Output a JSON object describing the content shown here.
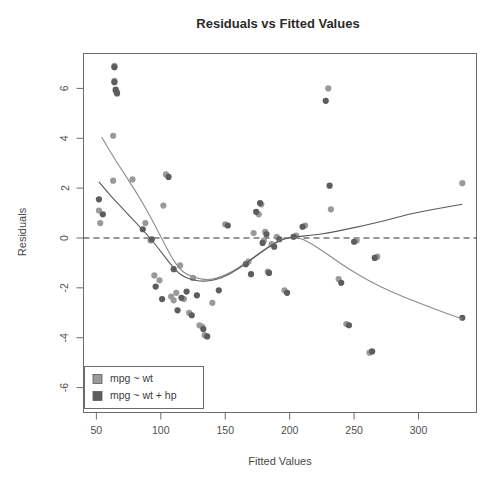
{
  "chart_data": {
    "type": "scatter",
    "title": "Residuals vs Fitted Values",
    "xlabel": "Fitted Values",
    "ylabel": "Residuals",
    "xlim": [
      40,
      345
    ],
    "ylim": [
      -7.0,
      7.4
    ],
    "xticks": [
      50,
      100,
      150,
      200,
      250,
      300
    ],
    "yticks": [
      6,
      4,
      2,
      0,
      -2,
      -4,
      -6
    ],
    "xtick_labels": [
      "50",
      "100",
      "150",
      "200",
      "250",
      "300"
    ],
    "ytick_labels": [
      "6",
      "4",
      "2",
      "0",
      "-2",
      "-4",
      "-6"
    ],
    "grid": false,
    "legend_position": "bottom-left",
    "reference_line": {
      "y": 0,
      "style": "dashed",
      "color": "#2f2f2f"
    },
    "series": [
      {
        "name": "mpg ~ wt",
        "color": "#9a9a9a",
        "marker": "circle",
        "points": [
          [
            52,
            1.1
          ],
          [
            53,
            0.6
          ],
          [
            63,
            4.1
          ],
          [
            63,
            2.3
          ],
          [
            64,
            6.9
          ],
          [
            64,
            6.3
          ],
          [
            65,
            5.9
          ],
          [
            66,
            5.85
          ],
          [
            78,
            2.35
          ],
          [
            88,
            0.6
          ],
          [
            92,
            -0.1
          ],
          [
            95,
            -1.5
          ],
          [
            99,
            -1.7
          ],
          [
            102,
            1.3
          ],
          [
            104,
            2.55
          ],
          [
            108,
            -2.35
          ],
          [
            110,
            -2.5
          ],
          [
            112,
            -2.2
          ],
          [
            115,
            -1.1
          ],
          [
            118,
            -2.45
          ],
          [
            122,
            -3.0
          ],
          [
            125,
            -1.6
          ],
          [
            130,
            -3.5
          ],
          [
            132,
            -3.55
          ],
          [
            134,
            -3.9
          ],
          [
            140,
            -2.6
          ],
          [
            150,
            0.55
          ],
          [
            168,
            -0.95
          ],
          [
            172,
            0.2
          ],
          [
            176,
            0.95
          ],
          [
            178,
            1.35
          ],
          [
            180,
            -0.1
          ],
          [
            181,
            0.25
          ],
          [
            183,
            -1.35
          ],
          [
            186,
            -0.25
          ],
          [
            190,
            0.05
          ],
          [
            196,
            -2.1
          ],
          [
            205,
            0.1
          ],
          [
            212,
            0.5
          ],
          [
            230,
            6.0
          ],
          [
            232,
            1.15
          ],
          [
            238,
            -1.65
          ],
          [
            244,
            -3.45
          ],
          [
            252,
            -0.1
          ],
          [
            262,
            -4.6
          ],
          [
            268,
            -0.75
          ],
          [
            334,
            2.2
          ]
        ]
      },
      {
        "name": "mpg ~ wt + hp",
        "color": "#5d5d5d",
        "marker": "circle",
        "points": [
          [
            52,
            1.55
          ],
          [
            55,
            0.95
          ],
          [
            64,
            6.85
          ],
          [
            64,
            6.25
          ],
          [
            65,
            5.95
          ],
          [
            66,
            5.8
          ],
          [
            86,
            0.35
          ],
          [
            93,
            -0.05
          ],
          [
            96,
            -1.95
          ],
          [
            101,
            -2.45
          ],
          [
            106,
            2.45
          ],
          [
            110,
            -1.25
          ],
          [
            113,
            -2.9
          ],
          [
            116,
            -2.4
          ],
          [
            120,
            -2.15
          ],
          [
            124,
            -3.1
          ],
          [
            128,
            -2.3
          ],
          [
            133,
            -3.65
          ],
          [
            136,
            -3.95
          ],
          [
            145,
            -2.1
          ],
          [
            152,
            0.5
          ],
          [
            166,
            -1.05
          ],
          [
            170,
            -1.45
          ],
          [
            174,
            1.05
          ],
          [
            177,
            1.4
          ],
          [
            179,
            -0.2
          ],
          [
            182,
            0.15
          ],
          [
            184,
            -1.4
          ],
          [
            188,
            -0.35
          ],
          [
            192,
            -0.05
          ],
          [
            198,
            -2.2
          ],
          [
            203,
            0.05
          ],
          [
            210,
            0.45
          ],
          [
            228,
            5.5
          ],
          [
            231,
            2.1
          ],
          [
            240,
            -1.8
          ],
          [
            246,
            -3.5
          ],
          [
            250,
            -0.15
          ],
          [
            264,
            -4.55
          ],
          [
            266,
            -0.8
          ],
          [
            334,
            -3.2
          ]
        ]
      }
    ],
    "smoothers": [
      {
        "name": "mpg ~ wt smoother",
        "color": "#8c8c8c",
        "points": [
          [
            54,
            4.05
          ],
          [
            62,
            3.35
          ],
          [
            72,
            2.55
          ],
          [
            82,
            1.75
          ],
          [
            92,
            0.85
          ],
          [
            100,
            0.05
          ],
          [
            108,
            -0.75
          ],
          [
            116,
            -1.35
          ],
          [
            126,
            -1.6
          ],
          [
            138,
            -1.7
          ],
          [
            150,
            -1.5
          ],
          [
            162,
            -1.15
          ],
          [
            174,
            -0.7
          ],
          [
            186,
            -0.25
          ],
          [
            196,
            0.0
          ],
          [
            206,
            0.05
          ],
          [
            216,
            -0.2
          ],
          [
            228,
            -0.6
          ],
          [
            240,
            -1.05
          ],
          [
            254,
            -1.5
          ],
          [
            270,
            -1.95
          ],
          [
            290,
            -2.4
          ],
          [
            310,
            -2.8
          ],
          [
            334,
            -3.25
          ]
        ]
      },
      {
        "name": "mpg ~ wt + hp smoother",
        "color": "#5a5a5a",
        "points": [
          [
            52,
            2.25
          ],
          [
            60,
            1.75
          ],
          [
            70,
            1.2
          ],
          [
            80,
            0.65
          ],
          [
            90,
            0.1
          ],
          [
            98,
            -0.4
          ],
          [
            106,
            -0.95
          ],
          [
            114,
            -1.45
          ],
          [
            124,
            -1.7
          ],
          [
            136,
            -1.75
          ],
          [
            148,
            -1.6
          ],
          [
            160,
            -1.25
          ],
          [
            172,
            -0.8
          ],
          [
            184,
            -0.35
          ],
          [
            194,
            -0.05
          ],
          [
            204,
            0.05
          ],
          [
            216,
            0.1
          ],
          [
            230,
            0.2
          ],
          [
            244,
            0.35
          ],
          [
            258,
            0.5
          ],
          [
            274,
            0.7
          ],
          [
            292,
            0.95
          ],
          [
            312,
            1.15
          ],
          [
            334,
            1.35
          ]
        ]
      }
    ],
    "legend": [
      {
        "label": "mpg ~ wt",
        "color": "#9a9a9a"
      },
      {
        "label": "mpg ~ wt + hp",
        "color": "#5d5d5d"
      }
    ]
  }
}
